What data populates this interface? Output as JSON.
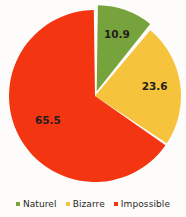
{
  "chart_data": {
    "type": "pie",
    "title": "",
    "categories": [
      "Naturel",
      "Bizarre",
      "Impossible"
    ],
    "values": [
      10.9,
      23.6,
      65.5
    ],
    "labels": [
      "10.9",
      "23.6",
      "65.5"
    ],
    "colors": [
      "#77a33c",
      "#f6c33c",
      "#f43512"
    ],
    "legend_position": "bottom",
    "start_angle_deg": 0,
    "direction": "clockwise",
    "exploded": [
      "Naturel"
    ],
    "background": "#fdfcfa",
    "label_color": "#231f1c"
  },
  "legend": {
    "items": [
      {
        "label": "Naturel",
        "color": "#77a33c"
      },
      {
        "label": "Bizarre",
        "color": "#f6c33c"
      },
      {
        "label": "Impossible",
        "color": "#f43512"
      }
    ]
  },
  "slices": [
    {
      "name": "Naturel",
      "label": "10.9"
    },
    {
      "name": "Bizarre",
      "label": "23.6"
    },
    {
      "name": "Impossible",
      "label": "65.5"
    }
  ]
}
